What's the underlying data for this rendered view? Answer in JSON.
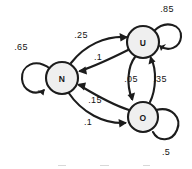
{
  "diagram": {
    "background_color": "#ffffff",
    "stroke_color": "#1c1c1c",
    "node_fill_color": "#efefef",
    "nodes": [
      {
        "id": "N",
        "label": "N",
        "cx": 62,
        "cy": 78,
        "r": 16
      },
      {
        "id": "U",
        "label": "U",
        "cx": 143,
        "cy": 42,
        "r": 16
      },
      {
        "id": "O",
        "label": "O",
        "cx": 143,
        "cy": 117,
        "r": 15
      }
    ],
    "transitions": [
      {
        "from": "N",
        "to": "N",
        "weight": ".65",
        "kind": "self-loop",
        "label_x": 21,
        "label_y": 47
      },
      {
        "from": "U",
        "to": "U",
        "weight": ".85",
        "kind": "self-loop",
        "label_x": 167,
        "label_y": 9
      },
      {
        "from": "O",
        "to": "O",
        "weight": ".5",
        "kind": "self-loop",
        "label_x": 166,
        "label_y": 152
      },
      {
        "from": "N",
        "to": "U",
        "weight": ".25",
        "kind": "curve",
        "label_x": 81,
        "label_y": 35
      },
      {
        "from": "U",
        "to": "N",
        "weight": ".1",
        "kind": "curve",
        "label_x": 98,
        "label_y": 57
      },
      {
        "from": "O",
        "to": "N",
        "weight": ".15",
        "kind": "curve",
        "label_x": 95,
        "label_y": 100
      },
      {
        "from": "N",
        "to": "O",
        "weight": ".1",
        "kind": "curve",
        "label_x": 88,
        "label_y": 122
      },
      {
        "from": "U",
        "to": "O",
        "weight": ".05",
        "kind": "curve",
        "label_x": 131,
        "label_y": 79
      },
      {
        "from": "O",
        "to": "U",
        "weight": ".35",
        "kind": "curve",
        "label_x": 160,
        "label_y": 79
      }
    ]
  }
}
